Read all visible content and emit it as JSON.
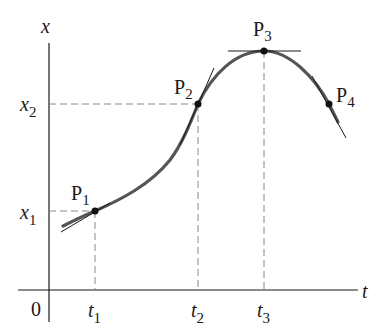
{
  "diagram": {
    "axes": {
      "vertical_label": "x",
      "horizontal_label": "t",
      "origin_label": "0"
    },
    "y_ticks": [
      {
        "label": "x",
        "sub": "1"
      },
      {
        "label": "x",
        "sub": "2"
      }
    ],
    "x_ticks": [
      {
        "label": "t",
        "sub": "1"
      },
      {
        "label": "t",
        "sub": "2"
      },
      {
        "label": "t",
        "sub": "3"
      }
    ],
    "points": [
      {
        "label": "P",
        "sub": "1"
      },
      {
        "label": "P",
        "sub": "2"
      },
      {
        "label": "P",
        "sub": "3"
      },
      {
        "label": "P",
        "sub": "4"
      }
    ],
    "colors": {
      "curve": "#555555",
      "axis": "#1a1a1a",
      "dashed": "#888888",
      "tangent": "#1a1a1a"
    }
  }
}
